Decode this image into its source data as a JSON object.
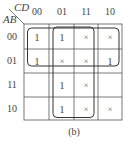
{
  "kmap": {
    "row_var": "AB",
    "col_var": "CD",
    "col_headers": [
      "00",
      "01",
      "11",
      "10"
    ],
    "row_headers": [
      "00",
      "01",
      "11",
      "10"
    ],
    "cells": [
      [
        "1",
        "1",
        "×",
        "×"
      ],
      [
        "1",
        "×",
        "×",
        "1"
      ],
      [
        "",
        "1",
        "×",
        ""
      ],
      [
        "",
        "1",
        "×",
        "×"
      ]
    ],
    "groups": [
      {
        "name": "rows-00-01-all-columns",
        "rows": [
          "00",
          "01"
        ],
        "cols": [
          "00",
          "01",
          "11",
          "10"
        ]
      },
      {
        "name": "columns-01-11-all-rows",
        "rows": [
          "00",
          "01",
          "11",
          "10"
        ],
        "cols": [
          "01",
          "11"
        ]
      }
    ],
    "caption": "(b)"
  }
}
